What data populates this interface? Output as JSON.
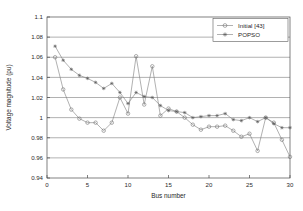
{
  "chart_data": {
    "type": "line",
    "title": "",
    "xlabel": "Bus number",
    "ylabel": "Voltage magnitude (pu)",
    "xlim": [
      0,
      30
    ],
    "ylim": [
      0.94,
      1.1
    ],
    "xticks": [
      0,
      5,
      10,
      15,
      20,
      25,
      30
    ],
    "xtick_labels": [
      "0",
      "5",
      "10",
      "15",
      "20",
      "25",
      "30"
    ],
    "yticks": [
      0.94,
      0.96,
      0.98,
      1,
      1.02,
      1.04,
      1.06,
      1.08,
      1.1
    ],
    "ytick_labels": [
      "0.94",
      "0.96",
      "0.98",
      "1",
      "1.02",
      "1.04",
      "1.06",
      "1.08",
      "1.1"
    ],
    "grid": "horizontal",
    "legend_position": "top-right",
    "x": [
      1,
      2,
      3,
      4,
      5,
      6,
      7,
      8,
      9,
      10,
      11,
      12,
      13,
      14,
      15,
      16,
      17,
      18,
      19,
      20,
      21,
      22,
      23,
      24,
      25,
      26,
      27,
      28,
      29,
      30
    ],
    "series": [
      {
        "name": "Initial [43]",
        "marker": "circle",
        "values": [
          1.06,
          1.028,
          1.008,
          0.999,
          0.995,
          0.995,
          0.987,
          0.995,
          1.02,
          1.004,
          1.061,
          1.013,
          1.051,
          1.002,
          1.009,
          1.006,
          1.0,
          0.993,
          0.988,
          0.991,
          0.991,
          0.992,
          0.987,
          0.981,
          0.984,
          0.967,
          1.0,
          0.995,
          0.978,
          0.961
        ]
      },
      {
        "name": "POPSO",
        "marker": "star",
        "values": [
          1.071,
          1.057,
          1.048,
          1.042,
          1.039,
          1.035,
          1.029,
          1.034,
          1.025,
          1.014,
          1.025,
          1.021,
          1.02,
          1.012,
          1.007,
          1.006,
          1.005,
          1.0,
          1.001,
          1.002,
          1.002,
          1.004,
          0.998,
          0.997,
          1.0,
          0.996,
          1.0,
          0.994,
          0.99,
          0.99
        ]
      }
    ]
  },
  "legend": {
    "entries": [
      {
        "label": "Initial [43]"
      },
      {
        "label": "POPSO"
      }
    ]
  },
  "axes": {
    "x_title": "Bus number",
    "y_title": "Voltage magnitude (pu)"
  }
}
